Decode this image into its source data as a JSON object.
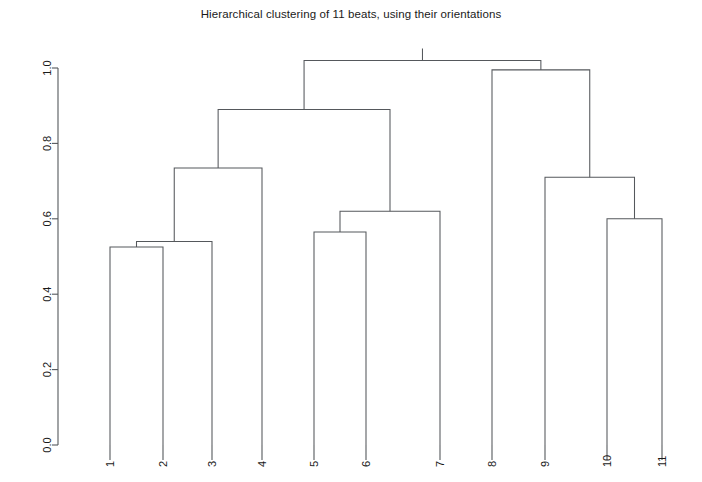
{
  "plot": {
    "title": "Hierarchical clustering of 11 beats, using their orientations",
    "background_color": "#ffffff",
    "line_color": "#55585c",
    "text_color": "#1a1a1a"
  },
  "chart_data": {
    "type": "line",
    "subtype": "dendrogram",
    "title": "Hierarchical clustering of 11 beats, using their orientations",
    "xlabel": "",
    "ylabel": "",
    "grid": false,
    "legend": false,
    "ylim": [
      0.0,
      1.0
    ],
    "ytick_labels": [
      "0.0",
      "0.2",
      "0.4",
      "0.6",
      "0.8",
      "1.0"
    ],
    "ytick_values": [
      0.0,
      0.2,
      0.4,
      0.6,
      0.8,
      1.0
    ],
    "leaf_order": [
      "1",
      "2",
      "3",
      "4",
      "5",
      "6",
      "7",
      "8",
      "9",
      "10",
      "11"
    ],
    "leaf_count": 11,
    "merges": [
      {
        "id": "m1",
        "left": "1",
        "right": "2",
        "height": 0.525
      },
      {
        "id": "m2",
        "left": "m1",
        "right": "3",
        "height": 0.54
      },
      {
        "id": "m3",
        "left": "m2",
        "right": "4",
        "height": 0.735
      },
      {
        "id": "m4",
        "left": "5",
        "right": "6",
        "height": 0.565
      },
      {
        "id": "m5",
        "left": "m4",
        "right": "7",
        "height": 0.62
      },
      {
        "id": "m6",
        "left": "m3",
        "right": "m5",
        "height": 0.89
      },
      {
        "id": "m7",
        "left": "10",
        "right": "11",
        "height": 0.6
      },
      {
        "id": "m8",
        "left": "9",
        "right": "m7",
        "height": 0.71
      },
      {
        "id": "m9",
        "left": "8",
        "right": "m8",
        "height": 0.995
      },
      {
        "id": "m10",
        "left": "m6",
        "right": "m9",
        "height": 1.02
      }
    ],
    "merge_heights": [
      0.525,
      0.54,
      0.735,
      0.565,
      0.62,
      0.89,
      0.6,
      0.71,
      0.995,
      1.02
    ]
  },
  "geometry": {
    "y_top_px": 68,
    "y_bottom_px": 445,
    "y_top_value": 1.0,
    "y_bottom_value": 0.0,
    "leaf_x_px": [
      110,
      163,
      212,
      262,
      314,
      366,
      440,
      492,
      545,
      607,
      662
    ]
  }
}
